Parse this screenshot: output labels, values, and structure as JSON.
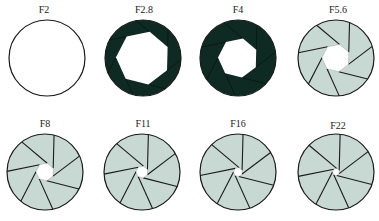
{
  "colors": {
    "background": "#ffffff",
    "outline": "#1a1a1a",
    "dark_fill": "#0f2a22",
    "light_fill": "#c8d8d3",
    "opening": "#ffffff"
  },
  "apertures": [
    {
      "label": "F2",
      "cx": 47,
      "cy": 58,
      "r": 38,
      "hole": 38,
      "blades": 0,
      "fill": "none",
      "label_x": 44,
      "label_y": 5
    },
    {
      "label": "F2.8",
      "cx": 143,
      "cy": 58,
      "r": 38,
      "hole": 27,
      "blades": 7,
      "fill": "dark",
      "label_x": 144,
      "label_y": 5
    },
    {
      "label": "F4",
      "cx": 238,
      "cy": 58,
      "r": 38,
      "hole": 20,
      "blades": 7,
      "fill": "dark",
      "label_x": 238,
      "label_y": 5
    },
    {
      "label": "F5.6",
      "cx": 336,
      "cy": 58,
      "r": 38,
      "hole": 14,
      "blades": 7,
      "fill": "light",
      "label_x": 338,
      "label_y": 5
    },
    {
      "label": "F8",
      "cx": 45,
      "cy": 172,
      "r": 38,
      "hole": 9,
      "blades": 7,
      "fill": "light",
      "label_x": 45,
      "label_y": 119
    },
    {
      "label": "F11",
      "cx": 142,
      "cy": 172,
      "r": 38,
      "hole": 6,
      "blades": 7,
      "fill": "light",
      "label_x": 143,
      "label_y": 119
    },
    {
      "label": "F16",
      "cx": 238,
      "cy": 172,
      "r": 38,
      "hole": 4.5,
      "blades": 7,
      "fill": "light",
      "label_x": 238,
      "label_y": 119
    },
    {
      "label": "F22",
      "cx": 336,
      "cy": 172,
      "r": 38,
      "hole": 3.5,
      "blades": 7,
      "fill": "light",
      "label_x": 338,
      "label_y": 121
    }
  ]
}
